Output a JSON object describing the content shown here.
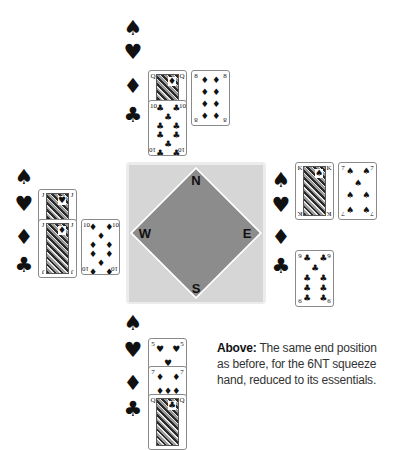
{
  "table": {
    "directions": {
      "north": "N",
      "south": "S",
      "east": "E",
      "west": "W"
    },
    "colors": {
      "outer": "#ececec",
      "inner": "#d6d6d6",
      "diamond": "#8c8c8c"
    }
  },
  "suits": {
    "spades": "♠",
    "hearts": "♥",
    "diamonds": "♦",
    "clubs": "♣"
  },
  "hands": {
    "north": {
      "spades": [],
      "hearts": [],
      "diamonds": [
        {
          "rank": "Q",
          "suit": "♦",
          "face": true
        },
        {
          "rank": "8",
          "suit": "♦"
        }
      ],
      "clubs": [
        {
          "rank": "10",
          "suit": "♣"
        }
      ]
    },
    "west": {
      "spades": [],
      "hearts": [
        {
          "rank": "J",
          "suit": "♥",
          "face": true
        }
      ],
      "diamonds": [
        {
          "rank": "J",
          "suit": "♦",
          "face": true
        },
        {
          "rank": "10",
          "suit": "♦"
        }
      ],
      "clubs": []
    },
    "east": {
      "spades": [
        {
          "rank": "K",
          "suit": "♠",
          "face": true
        },
        {
          "rank": "7",
          "suit": "♠"
        }
      ],
      "hearts": [],
      "diamonds": [],
      "clubs": [
        {
          "rank": "9",
          "suit": "♣"
        }
      ]
    },
    "south": {
      "spades": [],
      "hearts": [
        {
          "rank": "5",
          "suit": "♥"
        }
      ],
      "diamonds": [
        {
          "rank": "7",
          "suit": "♦"
        }
      ],
      "clubs": [
        {
          "rank": "Q",
          "suit": "♣",
          "face": true
        }
      ]
    }
  },
  "caption": {
    "bold": "Above:",
    "text": " The same end position as before, for the 6NT squeeze hand, reduced to its essentials."
  }
}
